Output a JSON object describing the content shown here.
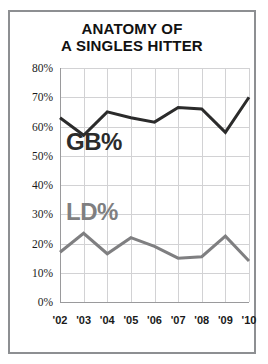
{
  "card": {
    "border_color": "#8d8f92",
    "background": "#ffffff"
  },
  "chart_data": {
    "type": "line",
    "title": "ANATOMY OF A SINGLES HITTER",
    "title_lines": [
      "ANATOMY OF",
      "A SINGLES HITTER"
    ],
    "xlabel": "",
    "ylabel": "",
    "categories": [
      "'02",
      "'03",
      "'04",
      "'05",
      "'06",
      "'07",
      "'08",
      "'09",
      "'10"
    ],
    "x": [
      "'02",
      "'03",
      "'04",
      "'05",
      "'06",
      "'07",
      "'08",
      "'09",
      "'10"
    ],
    "ylim": [
      0,
      80
    ],
    "ytick_labels": [
      "0%",
      "10%",
      "20%",
      "30%",
      "40%",
      "50%",
      "60%",
      "70%",
      "80%"
    ],
    "ytick_values": [
      0,
      10,
      20,
      30,
      40,
      50,
      60,
      70,
      80
    ],
    "grid": true,
    "legend": "inline-labels",
    "series": [
      {
        "name": "GB%",
        "color": "#2b2b2b",
        "values": [
          63,
          57,
          65,
          63,
          61.5,
          66.5,
          66,
          58,
          70
        ],
        "label_text": "GB%",
        "label_x": "'02",
        "label_y": 52
      },
      {
        "name": "LD%",
        "color": "#7f7f81",
        "values": [
          17,
          23.5,
          16.5,
          22,
          19,
          15,
          15.5,
          22.5,
          14
        ],
        "label_text": "LD%",
        "label_x": "'02",
        "label_y": 28
      }
    ]
  }
}
